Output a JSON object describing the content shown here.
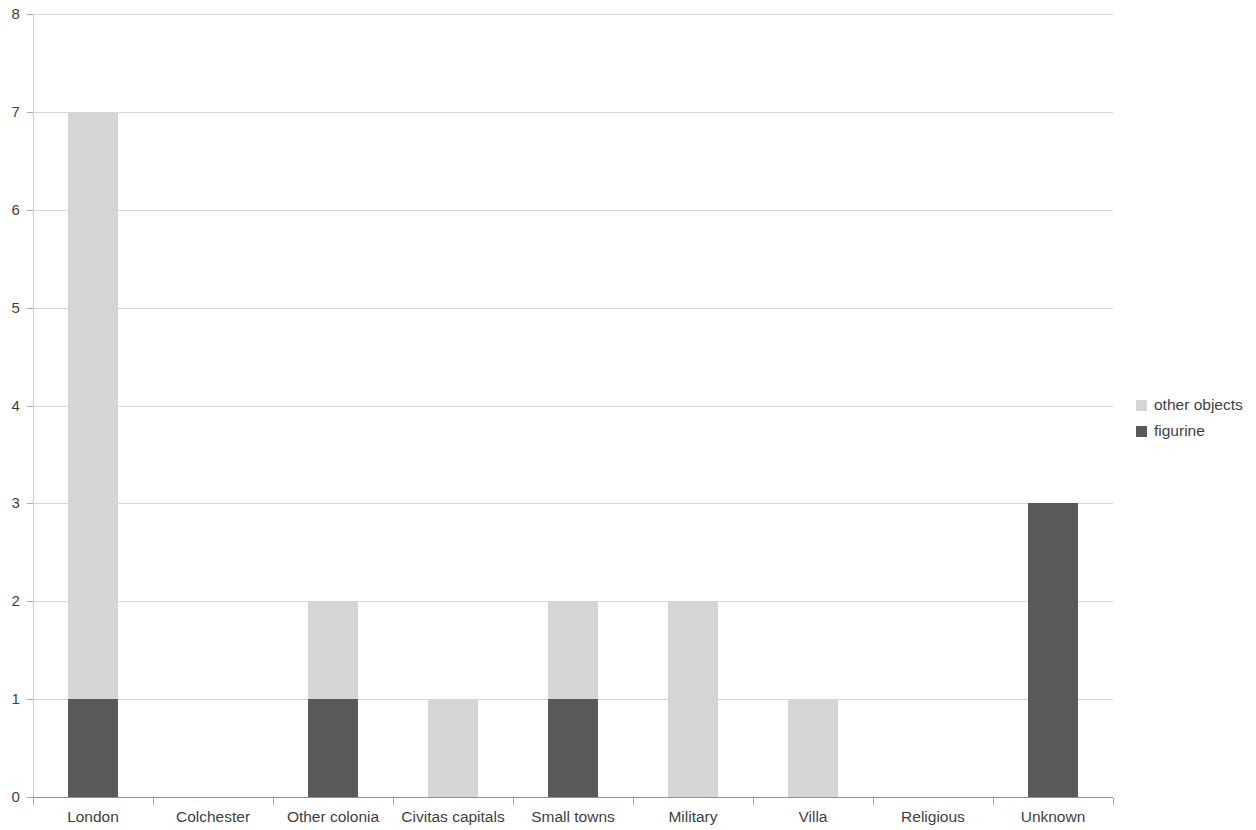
{
  "chart_data": {
    "type": "bar",
    "subtype": "stacked-column",
    "title": "",
    "subtitle": "",
    "xlabel": "",
    "ylabel": "",
    "ylim": [
      0,
      8
    ],
    "y_ticks": [
      0,
      1,
      2,
      3,
      4,
      5,
      6,
      7,
      8
    ],
    "y_tick_labels": [
      "0",
      "1",
      "2",
      "3",
      "4",
      "5",
      "6",
      "7",
      "8"
    ],
    "grid": true,
    "grid_axis": "y",
    "legend_position": "right",
    "categories": [
      "London",
      "Colchester",
      "Other colonia",
      "Civitas capitals",
      "Small towns",
      "Military",
      "Villa",
      "Religious",
      "Unknown"
    ],
    "series": [
      {
        "name": "figurine",
        "color": "#595959",
        "stack_order": 0,
        "values": [
          1,
          0,
          1,
          0,
          1,
          0,
          0,
          0,
          3
        ]
      },
      {
        "name": "other objects",
        "color": "#d5d5d5",
        "stack_order": 1,
        "values": [
          6,
          0,
          1,
          1,
          1,
          2,
          1,
          0,
          0
        ]
      }
    ],
    "totals": [
      7,
      0,
      2,
      1,
      2,
      2,
      1,
      0,
      3
    ],
    "annotations": []
  },
  "legend": {
    "items": [
      {
        "label": "other objects",
        "color": "#d5d5d5"
      },
      {
        "label": "figurine",
        "color": "#595959"
      }
    ]
  },
  "colors": {
    "other_objects": "#d5d5d5",
    "figurine": "#595959",
    "gridline": "#d9d9d9",
    "axis": "#909090",
    "text": "#3f3f3f",
    "background": "#ffffff"
  }
}
